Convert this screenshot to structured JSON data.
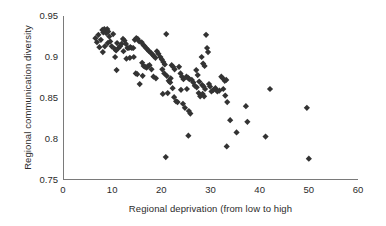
{
  "chart_data": {
    "type": "scatter",
    "title": "",
    "xlabel": "Regional deprivation (from low to high",
    "ylabel": "Regional communication diversity",
    "xlim": [
      0,
      60
    ],
    "ylim": [
      0.75,
      0.95
    ],
    "xticks": [
      0,
      10,
      20,
      30,
      40,
      50,
      60
    ],
    "xtick_labels": [
      "0",
      "10",
      "20",
      "30",
      "40",
      "50",
      "60"
    ],
    "yticks": [
      0.75,
      0.8,
      0.85,
      0.9,
      0.95
    ],
    "ytick_labels": [
      "0.75",
      "0.8",
      "0.85",
      "0.9",
      "0.95"
    ],
    "grid": false,
    "legend": false,
    "marker": "diamond",
    "marker_color": "#333333",
    "marker_size": 3.1,
    "axis_color": "#7a7a7a",
    "background": "#ffffff",
    "n_points": 141,
    "series": [
      {
        "name": "regions",
        "points": [
          [
            6.6,
            0.923
          ],
          [
            6.9,
            0.918
          ],
          [
            7.2,
            0.927
          ],
          [
            7.4,
            0.912
          ],
          [
            7.7,
            0.921
          ],
          [
            8.0,
            0.933
          ],
          [
            8.2,
            0.93
          ],
          [
            8.4,
            0.934
          ],
          [
            8.6,
            0.932
          ],
          [
            8.8,
            0.929
          ],
          [
            9.0,
            0.934
          ],
          [
            9.2,
            0.931
          ],
          [
            9.4,
            0.925
          ],
          [
            9.1,
            0.917
          ],
          [
            8.5,
            0.913
          ],
          [
            8.1,
            0.906
          ],
          [
            9.6,
            0.919
          ],
          [
            9.9,
            0.913
          ],
          [
            10.2,
            0.928
          ],
          [
            10.5,
            0.91
          ],
          [
            10.8,
            0.908
          ],
          [
            11.0,
            0.917
          ],
          [
            11.3,
            0.911
          ],
          [
            11.6,
            0.913
          ],
          [
            10.6,
            0.9
          ],
          [
            10.9,
            0.884
          ],
          [
            11.9,
            0.916
          ],
          [
            12.2,
            0.922
          ],
          [
            12.5,
            0.92
          ],
          [
            12.8,
            0.916
          ],
          [
            13.1,
            0.911
          ],
          [
            13.4,
            0.911
          ],
          [
            13.7,
            0.912
          ],
          [
            14.0,
            0.911
          ],
          [
            14.3,
            0.911
          ],
          [
            12.3,
            0.907
          ],
          [
            12.9,
            0.898
          ],
          [
            13.6,
            0.899
          ],
          [
            14.6,
            0.921
          ],
          [
            14.9,
            0.923
          ],
          [
            15.2,
            0.922
          ],
          [
            15.5,
            0.919
          ],
          [
            14.4,
            0.9
          ],
          [
            14.8,
            0.88
          ],
          [
            15.1,
            0.879
          ],
          [
            15.6,
            0.867
          ],
          [
            16.0,
            0.918
          ],
          [
            16.3,
            0.915
          ],
          [
            16.6,
            0.913
          ],
          [
            16.9,
            0.911
          ],
          [
            17.2,
            0.909
          ],
          [
            17.5,
            0.907
          ],
          [
            16.1,
            0.893
          ],
          [
            16.4,
            0.889
          ],
          [
            16.7,
            0.888
          ],
          [
            17.0,
            0.887
          ],
          [
            17.3,
            0.889
          ],
          [
            17.6,
            0.89
          ],
          [
            16.2,
            0.877
          ],
          [
            17.9,
            0.905
          ],
          [
            18.2,
            0.903
          ],
          [
            18.5,
            0.901
          ],
          [
            18.8,
            0.899
          ],
          [
            19.1,
            0.907
          ],
          [
            19.4,
            0.904
          ],
          [
            18.0,
            0.885
          ],
          [
            18.4,
            0.876
          ],
          [
            18.9,
            0.874
          ],
          [
            19.8,
            0.9
          ],
          [
            20.1,
            0.897
          ],
          [
            20.4,
            0.894
          ],
          [
            20.7,
            0.891
          ],
          [
            21.0,
            0.928
          ],
          [
            20.2,
            0.885
          ],
          [
            20.6,
            0.88
          ],
          [
            21.1,
            0.877
          ],
          [
            20.3,
            0.855
          ],
          [
            21.3,
            0.856
          ],
          [
            21.5,
            0.871
          ],
          [
            21.8,
            0.869
          ],
          [
            22.1,
            0.89
          ],
          [
            22.4,
            0.888
          ],
          [
            22.7,
            0.885
          ],
          [
            21.9,
            0.874
          ],
          [
            22.3,
            0.862
          ],
          [
            22.6,
            0.851
          ],
          [
            23.0,
            0.846
          ],
          [
            23.3,
            0.845
          ],
          [
            23.6,
            0.888
          ],
          [
            23.9,
            0.88
          ],
          [
            24.2,
            0.876
          ],
          [
            24.5,
            0.873
          ],
          [
            24.0,
            0.86
          ],
          [
            24.4,
            0.843
          ],
          [
            24.8,
            0.838
          ],
          [
            25.1,
            0.876
          ],
          [
            25.4,
            0.875
          ],
          [
            25.7,
            0.873
          ],
          [
            25.2,
            0.861
          ],
          [
            25.6,
            0.834
          ],
          [
            25.9,
            0.831
          ],
          [
            26.2,
            0.872
          ],
          [
            26.5,
            0.869
          ],
          [
            26.8,
            0.865
          ],
          [
            27.1,
            0.884
          ],
          [
            27.4,
            0.878
          ],
          [
            27.7,
            0.87
          ],
          [
            27.2,
            0.863
          ],
          [
            27.6,
            0.856
          ],
          [
            27.9,
            0.852
          ],
          [
            28.2,
            0.9
          ],
          [
            28.5,
            0.892
          ],
          [
            28.8,
            0.889
          ],
          [
            28.3,
            0.866
          ],
          [
            28.6,
            0.864
          ],
          [
            28.9,
            0.861
          ],
          [
            28.4,
            0.855
          ],
          [
            28.7,
            0.852
          ],
          [
            29.1,
            0.927
          ],
          [
            29.3,
            0.911
          ],
          [
            29.5,
            0.906
          ],
          [
            29.7,
            0.867
          ],
          [
            29.9,
            0.864
          ],
          [
            30.2,
            0.858
          ],
          [
            30.6,
            0.86
          ],
          [
            31.0,
            0.862
          ],
          [
            31.4,
            0.858
          ],
          [
            31.8,
            0.859
          ],
          [
            32.2,
            0.876
          ],
          [
            32.5,
            0.874
          ],
          [
            32.9,
            0.871
          ],
          [
            33.2,
            0.872
          ],
          [
            32.6,
            0.861
          ],
          [
            33.0,
            0.853
          ],
          [
            33.4,
            0.845
          ],
          [
            34.0,
            0.823
          ],
          [
            33.3,
            0.791
          ],
          [
            35.3,
            0.808
          ],
          [
            37.2,
            0.84
          ],
          [
            37.5,
            0.821
          ],
          [
            41.2,
            0.803
          ],
          [
            42.1,
            0.861
          ],
          [
            49.6,
            0.838
          ],
          [
            50.0,
            0.776
          ],
          [
            20.9,
            0.778
          ],
          [
            25.5,
            0.804
          ]
        ]
      }
    ]
  },
  "axes": {
    "x_axis_name": "x-axis",
    "y_axis_name": "y-axis"
  }
}
